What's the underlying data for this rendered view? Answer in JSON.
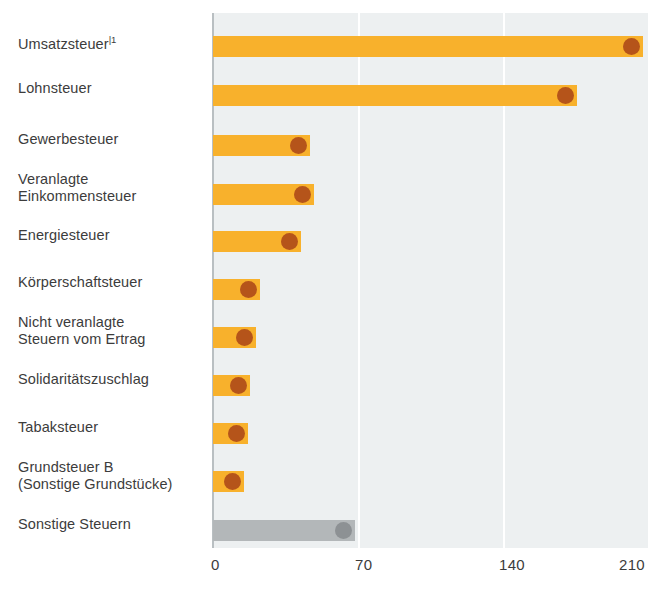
{
  "chart_data": {
    "type": "bar",
    "orientation": "horizontal",
    "title": "",
    "subtitle": "",
    "xlabel": "",
    "ylabel": "",
    "xlim": [
      0,
      210
    ],
    "xticks": [
      "0",
      "70",
      "140",
      "210"
    ],
    "xtick_values": [
      0,
      70,
      140,
      210
    ],
    "grid": "vertical gridlines at 70 and 140",
    "legend": "none",
    "categories": [
      "Umsatzsteuer",
      "Lohnsteuer",
      "Gewerbesteuer",
      "Veranlagte\nEinkommensteuer",
      "Energiesteuer",
      "Körperschaftsteuer",
      "Nicht veranlagte\nSteuern vom Ertrag",
      "Solidaritätszuschlag",
      "Tabaksteuer",
      "Grundsteuer B\n(Sonstige Grundstücke)",
      "Sonstige Steuern"
    ],
    "values": [
      209,
      177,
      47,
      49,
      43,
      23,
      21,
      18,
      17,
      15,
      69
    ],
    "footnote_markers": [
      "|1",
      "",
      "",
      "",
      "",
      "",
      "",
      "",
      "",
      "",
      ""
    ],
    "bar_colors": [
      "#f8b12c",
      "#f8b12c",
      "#f8b12c",
      "#f8b12c",
      "#f8b12c",
      "#f8b12c",
      "#f8b12c",
      "#f8b12c",
      "#f8b12c",
      "#f8b12c",
      "#b3b7b9"
    ],
    "dot_colors": [
      "#b5541a",
      "#b5541a",
      "#b5541a",
      "#b5541a",
      "#b5541a",
      "#b5541a",
      "#b5541a",
      "#b5541a",
      "#b5541a",
      "#b5541a",
      "#8d9194"
    ]
  },
  "colors": {
    "bar_orange": "#f8b12c",
    "dot_brown": "#b5541a",
    "bar_gray": "#b3b7b9",
    "dot_gray": "#8d9194",
    "plot_background": "#edf0f1",
    "gridline": "#ffffff",
    "axis_line": "#b9bfc2",
    "text": "#3c3c3c",
    "page_background": "#ffffff"
  }
}
